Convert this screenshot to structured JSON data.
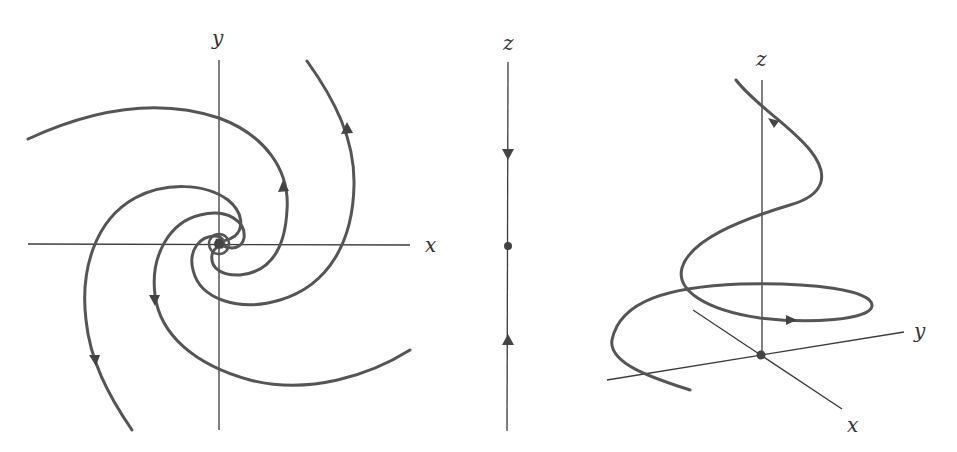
{
  "figure": {
    "panels": [
      {
        "id": "phase-portrait-xy",
        "description": "Stable spiral in xy-plane: trajectories spiral into origin",
        "axis_labels": {
          "horizontal": "x",
          "vertical": "y"
        }
      },
      {
        "id": "z-line",
        "description": "z-axis with trajectories approaching fixed point",
        "axis_labels": {
          "vertical": "z"
        }
      },
      {
        "id": "3d-trajectory",
        "description": "Helical trajectory spiraling down to origin in xyz-space",
        "axis_labels": {
          "z": "z",
          "y": "y",
          "x": "x"
        }
      }
    ],
    "colors": {
      "curve": "#555555",
      "axis": "#3a3a3a",
      "background": "#ffffff"
    }
  }
}
